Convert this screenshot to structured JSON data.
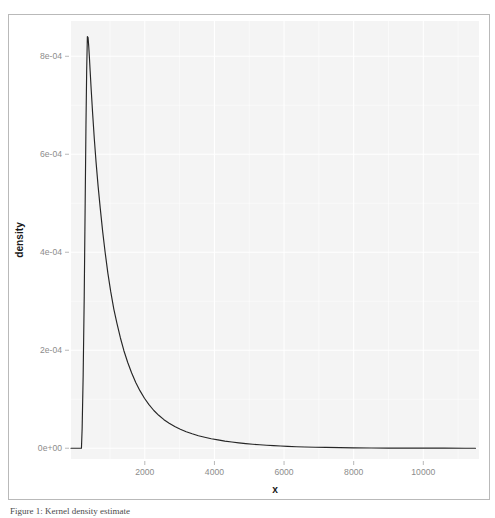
{
  "figure": {
    "border_color": "#b9b9b9",
    "background": "#ffffff"
  },
  "caption": {
    "text": "Figure 1: Kernel density estimate"
  },
  "chart_data": {
    "type": "line",
    "title": "",
    "subtitle": "",
    "xlabel": "x",
    "ylabel": "density",
    "panel_background": "#f4f4f4",
    "grid": true,
    "grid_color": "#ffffff",
    "legend": "none",
    "line_color": "#262626",
    "xlim": [
      -120,
      11600
    ],
    "ylim": [
      -2.2e-05,
      0.000872
    ],
    "xticks": [
      2000,
      4000,
      6000,
      8000,
      10000
    ],
    "xticklabels": [
      "2000",
      "4000",
      "6000",
      "8000",
      "10000"
    ],
    "yticks": [
      0.0,
      0.0002,
      0.0004,
      0.0006,
      0.0008
    ],
    "yticklabels": [
      "0e+00",
      "2e-04",
      "4e-04",
      "6e-04",
      "8e-04"
    ],
    "x_minor_ticks": [
      1000,
      3000,
      5000,
      7000,
      9000,
      11000
    ],
    "y_minor_ticks": [
      0.0001,
      0.0003,
      0.0005,
      0.0007
    ],
    "series": [
      {
        "name": "density",
        "x": [
          180,
          200,
          230,
          260,
          290,
          310,
          330,
          350,
          370,
          390,
          410,
          430,
          460,
          500,
          550,
          600,
          660,
          720,
          790,
          860,
          940,
          1020,
          1110,
          1200,
          1300,
          1400,
          1510,
          1620,
          1740,
          1860,
          1990,
          2120,
          2260,
          2400,
          2550,
          2700,
          2860,
          3020,
          3190,
          3360,
          3540,
          3720,
          3910,
          4100,
          4300,
          4500,
          4700,
          4900,
          5100,
          5300,
          5500,
          5700,
          5900,
          6100,
          6350,
          6600,
          6900,
          7200,
          7600,
          8000,
          8500,
          9000,
          9500,
          10000,
          10600,
          11200,
          11500
        ],
        "y": [
          0.0,
          4e-05,
          0.00015,
          0.00031,
          0.00052,
          0.00066,
          0.00077,
          0.00084,
          0.000838,
          0.00082,
          0.000796,
          0.00077,
          0.000732,
          0.000685,
          0.000631,
          0.000584,
          0.000534,
          0.00049,
          0.000442,
          0.0004,
          0.000357,
          0.00032,
          0.000284,
          0.000255,
          0.000225,
          0.000199,
          0.000175,
          0.000154,
          0.000134,
          0.0001175,
          0.000102,
          8.9e-05,
          7.7e-05,
          6.72e-05,
          5.83e-05,
          5.1e-05,
          4.42e-05,
          3.88e-05,
          3.36e-05,
          2.94e-05,
          2.55e-05,
          2.24e-05,
          1.94e-05,
          1.7e-05,
          1.46e-05,
          1.27e-05,
          1.1e-05,
          9.5e-06,
          8.2e-06,
          7.1e-06,
          6.1e-06,
          5.2e-06,
          4.5e-06,
          3.8e-06,
          3.1e-06,
          2.6e-06,
          2e-06,
          1.6e-06,
          1.1e-06,
          8e-07,
          5e-07,
          3e-07,
          2e-07,
          1e-07,
          1e-07,
          0.0,
          0.0
        ]
      }
    ],
    "baseline": {
      "x_start": 180,
      "x_end": 11500,
      "y": 0.0
    },
    "peak": {
      "x": 350,
      "y": 0.00084
    }
  }
}
